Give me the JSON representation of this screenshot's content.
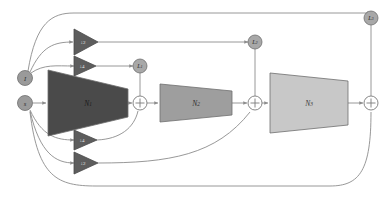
{
  "figure": {
    "name": "multi-scale-cascaded-network-diagram",
    "background_color": "#ffffff",
    "wire_color": "#8c8c8c",
    "width": 391,
    "height": 200
  },
  "inputs": [
    {
      "id": "input-i",
      "label": "I",
      "x": 25,
      "y": 78,
      "r": 7.5,
      "fill": "#9a9a9a"
    },
    {
      "id": "input-s",
      "label": "s",
      "x": 25,
      "y": 103,
      "r": 7.5,
      "fill": "#9a9a9a"
    }
  ],
  "blocks": [
    {
      "id": "block-n1",
      "label": "N",
      "subscript": "1",
      "fill": "#4a4a4a",
      "stroke": "#3d3d3d",
      "cx": 88,
      "cy": 103,
      "left_x": 48,
      "right_x": 128,
      "left_half_height": 33,
      "right_half_height": 14
    },
    {
      "id": "block-n2",
      "label": "N",
      "subscript": "2",
      "fill": "#9e9e9e",
      "stroke": "#7d7d7d",
      "cx": 196,
      "cy": 103,
      "left_x": 160,
      "right_x": 232,
      "left_half_height": 19,
      "right_half_height": 12
    },
    {
      "id": "block-n3",
      "label": "N",
      "subscript": "3",
      "fill": "#c8c8c8",
      "stroke": "#9a9a9a",
      "cx": 310,
      "cy": 103,
      "left_x": 270,
      "right_x": 348,
      "left_half_height": 30,
      "right_half_height": 22
    }
  ],
  "scalers": [
    {
      "id": "downsample-2-upper",
      "label": "↓2",
      "cx": 85,
      "cy": 42,
      "half_height": 13,
      "width": 24,
      "fill": "#5d5d5d"
    },
    {
      "id": "downsample-4-upper",
      "label": "↓4",
      "cx": 85,
      "cy": 66,
      "half_height": 10,
      "width": 22,
      "fill": "#5d5d5d"
    },
    {
      "id": "downsample-4-lower",
      "label": "↓4",
      "cx": 85,
      "cy": 140,
      "half_height": 10,
      "width": 22,
      "fill": "#5d5d5d"
    },
    {
      "id": "downsample-2-lower",
      "label": "↓2",
      "cx": 85,
      "cy": 163,
      "half_height": 11,
      "width": 23,
      "fill": "#5d5d5d"
    }
  ],
  "losses": [
    {
      "id": "loss-1",
      "label": "L",
      "subscript": "1",
      "x": 140,
      "y": 66,
      "r": 7,
      "fill": "#a8a8a8"
    },
    {
      "id": "loss-2",
      "label": "L",
      "subscript": "2",
      "x": 255,
      "y": 42,
      "r": 7,
      "fill": "#a8a8a8"
    },
    {
      "id": "loss-3",
      "label": "L",
      "subscript": "3",
      "x": 371,
      "y": 18,
      "r": 7,
      "fill": "#a8a8a8"
    }
  ],
  "adders": [
    {
      "id": "adder-1",
      "label": "+",
      "x": 140,
      "y": 103,
      "r": 7
    },
    {
      "id": "adder-2",
      "label": "+",
      "x": 255,
      "y": 103,
      "r": 7
    },
    {
      "id": "adder-3",
      "label": "+",
      "x": 371,
      "y": 103,
      "r": 7
    }
  ],
  "legend_notes": {
    "description": "Three cascaded network stages N1, N2, N3 with skip connections from inputs I and s through downsampling blocks, summation nodes and losses L1, L2, L3."
  }
}
